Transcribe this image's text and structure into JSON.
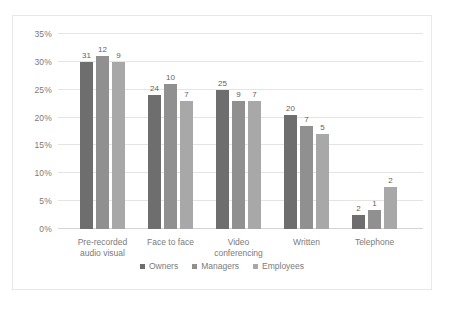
{
  "chart_data": {
    "type": "bar",
    "title": "",
    "subtitle": "",
    "xlabel": "",
    "ylabel": "",
    "ylim": [
      0,
      35
    ],
    "ytick_labels": [
      "0%",
      "5%",
      "10%",
      "15%",
      "20%",
      "25%",
      "30%",
      "35%"
    ],
    "ytick_values": [
      0,
      5,
      10,
      15,
      20,
      25,
      30,
      35
    ],
    "grid": true,
    "legend_position": "bottom",
    "categories": [
      "Pre-recorded audio visual",
      "Face to face",
      "Video conferencing",
      "Written",
      "Telephone"
    ],
    "category_lines": [
      [
        "Pre-recorded",
        "audio visual"
      ],
      [
        "Face to face",
        ""
      ],
      [
        "Video",
        "conferencing"
      ],
      [
        "Written",
        ""
      ],
      [
        "Telephone",
        ""
      ]
    ],
    "series": [
      {
        "name": "Owners",
        "color": "#6e6e6e",
        "values": [
          30.0,
          24.0,
          25.0,
          20.5,
          2.5
        ],
        "labels": [
          "31",
          "24",
          "25",
          "20",
          "2"
        ]
      },
      {
        "name": "Managers",
        "color": "#909090",
        "values": [
          31.0,
          26.0,
          23.0,
          18.5,
          3.5
        ],
        "labels": [
          "12",
          "10",
          "9",
          "7",
          "1"
        ]
      },
      {
        "name": "Employees",
        "color": "#a8a8a8",
        "values": [
          30.0,
          23.0,
          23.0,
          17.0,
          7.5
        ],
        "labels": [
          "9",
          "7",
          "7",
          "5",
          "2"
        ]
      }
    ]
  }
}
